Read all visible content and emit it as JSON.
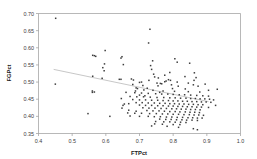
{
  "chart_data": {
    "type": "scatter",
    "title": "",
    "xlabel": "FTPct",
    "ylabel": "FGPct",
    "xlim": [
      0.4,
      1.0
    ],
    "ylim": [
      0.35,
      0.7
    ],
    "xticks": [
      "0.4",
      "0.5",
      "0.6",
      "0.7",
      "0.8",
      "0.9",
      "1.0"
    ],
    "yticks": [
      "0.35",
      "0.40",
      "0.45",
      "0.50",
      "0.55",
      "0.60",
      "0.65",
      "0.70"
    ],
    "grid": false,
    "legend": "none",
    "marker_color": "#3d3d3d",
    "trendline": {
      "visible": true,
      "color": "#b9b9b9",
      "x_start": 0.445,
      "y_start": 0.537,
      "x_end": 0.905,
      "y_end": 0.443
    },
    "points": [
      [
        0.451,
        0.686
      ],
      [
        0.731,
        0.654
      ],
      [
        0.727,
        0.614
      ],
      [
        0.598,
        0.592
      ],
      [
        0.561,
        0.578
      ],
      [
        0.566,
        0.577
      ],
      [
        0.57,
        0.575
      ],
      [
        0.648,
        0.574
      ],
      [
        0.645,
        0.57
      ],
      [
        0.805,
        0.568
      ],
      [
        0.739,
        0.562
      ],
      [
        0.812,
        0.558
      ],
      [
        0.849,
        0.555
      ],
      [
        0.596,
        0.553
      ],
      [
        0.652,
        0.551
      ],
      [
        0.733,
        0.548
      ],
      [
        0.591,
        0.542
      ],
      [
        0.736,
        0.537
      ],
      [
        0.595,
        0.533
      ],
      [
        0.863,
        0.527
      ],
      [
        0.742,
        0.523
      ],
      [
        0.561,
        0.517
      ],
      [
        0.745,
        0.515
      ],
      [
        0.868,
        0.513
      ],
      [
        0.589,
        0.511
      ],
      [
        0.676,
        0.509
      ],
      [
        0.645,
        0.508
      ],
      [
        0.682,
        0.506
      ],
      [
        0.786,
        0.507
      ],
      [
        0.792,
        0.505
      ],
      [
        0.779,
        0.503
      ],
      [
        0.775,
        0.501
      ],
      [
        0.812,
        0.5
      ],
      [
        0.7,
        0.499
      ],
      [
        0.45,
        0.494
      ],
      [
        0.752,
        0.497
      ],
      [
        0.762,
        0.496
      ],
      [
        0.766,
        0.495
      ],
      [
        0.86,
        0.492
      ],
      [
        0.71,
        0.49
      ],
      [
        0.755,
        0.489
      ],
      [
        0.874,
        0.488
      ],
      [
        0.931,
        0.479
      ],
      [
        0.69,
        0.483
      ],
      [
        0.694,
        0.481
      ],
      [
        0.723,
        0.482
      ],
      [
        0.798,
        0.481
      ],
      [
        0.836,
        0.48
      ],
      [
        0.56,
        0.474
      ],
      [
        0.566,
        0.471
      ],
      [
        0.713,
        0.477
      ],
      [
        0.74,
        0.476
      ],
      [
        0.77,
        0.474
      ],
      [
        0.804,
        0.473
      ],
      [
        0.845,
        0.472
      ],
      [
        0.879,
        0.471
      ],
      [
        0.66,
        0.47
      ],
      [
        0.686,
        0.469
      ],
      [
        0.706,
        0.468
      ],
      [
        0.726,
        0.467
      ],
      [
        0.748,
        0.466
      ],
      [
        0.766,
        0.465
      ],
      [
        0.784,
        0.465
      ],
      [
        0.8,
        0.464
      ],
      [
        0.818,
        0.463
      ],
      [
        0.834,
        0.463
      ],
      [
        0.852,
        0.462
      ],
      [
        0.87,
        0.461
      ],
      [
        0.888,
        0.46
      ],
      [
        0.905,
        0.459
      ],
      [
        0.672,
        0.458
      ],
      [
        0.692,
        0.457
      ],
      [
        0.712,
        0.457
      ],
      [
        0.732,
        0.456
      ],
      [
        0.752,
        0.455
      ],
      [
        0.772,
        0.455
      ],
      [
        0.79,
        0.454
      ],
      [
        0.806,
        0.454
      ],
      [
        0.822,
        0.453
      ],
      [
        0.838,
        0.453
      ],
      [
        0.852,
        0.452
      ],
      [
        0.866,
        0.452
      ],
      [
        0.88,
        0.451
      ],
      [
        0.894,
        0.451
      ],
      [
        0.908,
        0.45
      ],
      [
        0.646,
        0.452
      ],
      [
        0.655,
        0.436
      ],
      [
        0.651,
        0.432
      ],
      [
        0.68,
        0.449
      ],
      [
        0.7,
        0.448
      ],
      [
        0.718,
        0.448
      ],
      [
        0.736,
        0.447
      ],
      [
        0.754,
        0.447
      ],
      [
        0.77,
        0.446
      ],
      [
        0.786,
        0.446
      ],
      [
        0.8,
        0.445
      ],
      [
        0.814,
        0.445
      ],
      [
        0.828,
        0.444
      ],
      [
        0.842,
        0.444
      ],
      [
        0.856,
        0.443
      ],
      [
        0.87,
        0.443
      ],
      [
        0.884,
        0.442
      ],
      [
        0.898,
        0.442
      ],
      [
        0.912,
        0.441
      ],
      [
        0.69,
        0.44
      ],
      [
        0.708,
        0.44
      ],
      [
        0.726,
        0.439
      ],
      [
        0.744,
        0.439
      ],
      [
        0.76,
        0.438
      ],
      [
        0.776,
        0.438
      ],
      [
        0.79,
        0.437
      ],
      [
        0.804,
        0.437
      ],
      [
        0.818,
        0.436
      ],
      [
        0.832,
        0.436
      ],
      [
        0.846,
        0.435
      ],
      [
        0.86,
        0.435
      ],
      [
        0.874,
        0.434
      ],
      [
        0.888,
        0.434
      ],
      [
        0.7,
        0.433
      ],
      [
        0.718,
        0.432
      ],
      [
        0.736,
        0.432
      ],
      [
        0.754,
        0.431
      ],
      [
        0.77,
        0.431
      ],
      [
        0.786,
        0.43
      ],
      [
        0.8,
        0.43
      ],
      [
        0.814,
        0.429
      ],
      [
        0.828,
        0.429
      ],
      [
        0.842,
        0.428
      ],
      [
        0.856,
        0.428
      ],
      [
        0.87,
        0.427
      ],
      [
        0.884,
        0.427
      ],
      [
        0.905,
        0.426
      ],
      [
        0.71,
        0.425
      ],
      [
        0.728,
        0.424
      ],
      [
        0.746,
        0.424
      ],
      [
        0.764,
        0.423
      ],
      [
        0.78,
        0.423
      ],
      [
        0.796,
        0.422
      ],
      [
        0.81,
        0.422
      ],
      [
        0.824,
        0.421
      ],
      [
        0.838,
        0.421
      ],
      [
        0.852,
        0.42
      ],
      [
        0.866,
        0.42
      ],
      [
        0.88,
        0.419
      ],
      [
        0.668,
        0.418
      ],
      [
        0.69,
        0.415
      ],
      [
        0.722,
        0.417
      ],
      [
        0.74,
        0.416
      ],
      [
        0.758,
        0.416
      ],
      [
        0.774,
        0.415
      ],
      [
        0.79,
        0.414
      ],
      [
        0.806,
        0.414
      ],
      [
        0.82,
        0.413
      ],
      [
        0.836,
        0.413
      ],
      [
        0.85,
        0.412
      ],
      [
        0.864,
        0.412
      ],
      [
        0.878,
        0.411
      ],
      [
        0.665,
        0.41
      ],
      [
        0.686,
        0.409
      ],
      [
        0.706,
        0.409
      ],
      [
        0.73,
        0.408
      ],
      [
        0.75,
        0.408
      ],
      [
        0.768,
        0.407
      ],
      [
        0.784,
        0.407
      ],
      [
        0.8,
        0.406
      ],
      [
        0.816,
        0.406
      ],
      [
        0.832,
        0.405
      ],
      [
        0.848,
        0.405
      ],
      [
        0.862,
        0.404
      ],
      [
        0.876,
        0.404
      ],
      [
        0.89,
        0.403
      ],
      [
        0.547,
        0.408
      ],
      [
        0.612,
        0.4
      ],
      [
        0.672,
        0.401
      ],
      [
        0.7,
        0.4
      ],
      [
        0.726,
        0.4
      ],
      [
        0.744,
        0.399
      ],
      [
        0.762,
        0.399
      ],
      [
        0.78,
        0.398
      ],
      [
        0.796,
        0.398
      ],
      [
        0.812,
        0.397
      ],
      [
        0.828,
        0.397
      ],
      [
        0.844,
        0.396
      ],
      [
        0.858,
        0.396
      ],
      [
        0.872,
        0.395
      ],
      [
        0.886,
        0.395
      ],
      [
        0.76,
        0.392
      ],
      [
        0.778,
        0.391
      ],
      [
        0.794,
        0.391
      ],
      [
        0.81,
        0.39
      ],
      [
        0.826,
        0.39
      ],
      [
        0.84,
        0.389
      ],
      [
        0.856,
        0.389
      ],
      [
        0.872,
        0.388
      ],
      [
        0.748,
        0.385
      ],
      [
        0.772,
        0.384
      ],
      [
        0.79,
        0.384
      ],
      [
        0.806,
        0.383
      ],
      [
        0.822,
        0.383
      ],
      [
        0.838,
        0.382
      ],
      [
        0.745,
        0.378
      ],
      [
        0.768,
        0.377
      ],
      [
        0.8,
        0.376
      ],
      [
        0.82,
        0.376
      ],
      [
        0.736,
        0.372
      ],
      [
        0.782,
        0.371
      ],
      [
        0.816,
        0.368
      ],
      [
        0.86,
        0.364
      ],
      [
        0.872,
        0.361
      ],
      [
        0.92,
        0.448
      ],
      [
        0.926,
        0.432
      ],
      [
        0.7,
        0.462
      ],
      [
        0.76,
        0.47
      ],
      [
        0.845,
        0.497
      ],
      [
        0.815,
        0.488
      ],
      [
        0.795,
        0.492
      ],
      [
        0.68,
        0.493
      ],
      [
        0.64,
        0.508
      ],
      [
        0.56,
        0.47
      ],
      [
        0.775,
        0.52
      ],
      [
        0.79,
        0.528
      ],
      [
        0.835,
        0.516
      ],
      [
        0.862,
        0.505
      ],
      [
        0.895,
        0.494
      ],
      [
        0.905,
        0.476
      ],
      [
        0.756,
        0.512
      ],
      [
        0.728,
        0.505
      ],
      [
        0.706,
        0.5
      ],
      [
        0.688,
        0.474
      ],
      [
        0.716,
        0.46
      ],
      [
        0.668,
        0.437
      ],
      [
        0.648,
        0.424
      ]
    ]
  }
}
